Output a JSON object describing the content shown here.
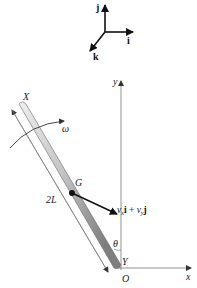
{
  "triad": {
    "j_label": "j",
    "i_label": "i",
    "k_label": "k"
  },
  "axes": {
    "y_label": "y",
    "x_label": "x",
    "origin_label": "O",
    "Y_label": "Y"
  },
  "rod": {
    "end_label": "X",
    "length_label": "2L",
    "angle_label": "θ",
    "angular_velocity_label": "ω",
    "center_label": "G"
  },
  "velocity": {
    "vx": "v",
    "vx_sub": "x",
    "i": "i",
    "plus": " + ",
    "vy": "v",
    "vy_sub": "y",
    "j": "j"
  },
  "colors": {
    "rod_light": "#e6e6e6",
    "rod_dark": "#8a8a8a",
    "line": "#555555",
    "arrow": "#111111"
  }
}
